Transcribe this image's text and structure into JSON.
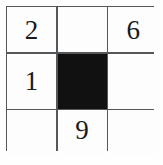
{
  "figure": {
    "name": "3x3-number-grid",
    "background_color": "#ffffff",
    "line_color": "#55585a",
    "cell_color": "#fdfdfd",
    "filled_cell_color": "#111111",
    "digit_color": "#1a1a1a"
  },
  "grid": {
    "rows": 3,
    "columns": 3,
    "cells": [
      {
        "row": 1,
        "col": 1,
        "value": "2",
        "filled": false
      },
      {
        "row": 1,
        "col": 2,
        "value": "",
        "filled": false
      },
      {
        "row": 1,
        "col": 3,
        "value": "6",
        "filled": false
      },
      {
        "row": 2,
        "col": 1,
        "value": "1",
        "filled": false
      },
      {
        "row": 2,
        "col": 2,
        "value": "",
        "filled": true
      },
      {
        "row": 2,
        "col": 3,
        "value": "",
        "filled": false
      },
      {
        "row": 3,
        "col": 1,
        "value": "",
        "filled": false
      },
      {
        "row": 3,
        "col": 2,
        "value": "9",
        "filled": false
      },
      {
        "row": 3,
        "col": 3,
        "value": "",
        "filled": false
      }
    ]
  }
}
